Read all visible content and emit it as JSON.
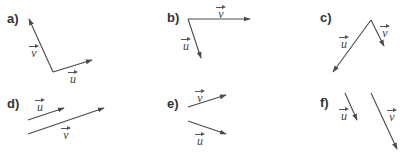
{
  "style": {
    "line_color": "#4a4a4a",
    "label_color": "#333333"
  },
  "panels": [
    {
      "id": "a",
      "label": "a)",
      "vectors": [
        {
          "name": "v",
          "x1": 53,
          "y1": 72,
          "x2": 29,
          "y2": 19,
          "label": "v"
        },
        {
          "name": "u",
          "x1": 53,
          "y1": 72,
          "x2": 92,
          "y2": 60,
          "label": "u"
        }
      ]
    },
    {
      "id": "b",
      "label": "b)",
      "vectors": [
        {
          "name": "v",
          "x1": 188,
          "y1": 19,
          "x2": 250,
          "y2": 19,
          "label": "v"
        },
        {
          "name": "u",
          "x1": 188,
          "y1": 19,
          "x2": 201,
          "y2": 58,
          "label": "u"
        }
      ]
    },
    {
      "id": "c",
      "label": "c)",
      "vectors": [
        {
          "name": "u",
          "x1": 371,
          "y1": 20,
          "x2": 333,
          "y2": 72,
          "label": "u"
        },
        {
          "name": "v",
          "x1": 371,
          "y1": 20,
          "x2": 384,
          "y2": 46,
          "label": "v"
        }
      ]
    },
    {
      "id": "d",
      "label": "d)",
      "vectors": [
        {
          "name": "u",
          "x1": 28,
          "y1": 120,
          "x2": 64,
          "y2": 108,
          "label": "u"
        },
        {
          "name": "v",
          "x1": 28,
          "y1": 134,
          "x2": 104,
          "y2": 108,
          "label": "v"
        }
      ]
    },
    {
      "id": "e",
      "label": "e)",
      "vectors": [
        {
          "name": "v",
          "x1": 188,
          "y1": 107,
          "x2": 226,
          "y2": 95,
          "label": "v"
        },
        {
          "name": "u",
          "x1": 188,
          "y1": 121,
          "x2": 226,
          "y2": 134,
          "label": "u"
        }
      ]
    },
    {
      "id": "f",
      "label": "f)",
      "vectors": [
        {
          "name": "u",
          "x1": 345,
          "y1": 93,
          "x2": 357,
          "y2": 120,
          "label": "u"
        },
        {
          "name": "v",
          "x1": 371,
          "y1": 93,
          "x2": 397,
          "y2": 149,
          "label": "v"
        }
      ]
    }
  ]
}
